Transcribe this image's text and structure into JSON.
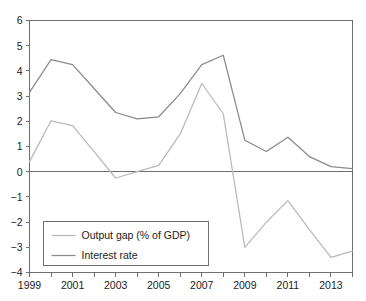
{
  "chart_data": {
    "type": "line",
    "title": "",
    "subtitle": "",
    "xlabel": "",
    "ylabel": "",
    "x": [
      1999,
      2000,
      2001,
      2002,
      2003,
      2004,
      2005,
      2006,
      2007,
      2008,
      2009,
      2010,
      2011,
      2012,
      2013,
      2014
    ],
    "xlim": [
      1999,
      2014
    ],
    "ylim": [
      -4,
      6
    ],
    "grid": false,
    "legend_position": "bottom-left",
    "x_tick_labels": [
      "1999",
      "2001",
      "2003",
      "2005",
      "2007",
      "2009",
      "2011",
      "2013"
    ],
    "x_tick_values": [
      1999,
      2001,
      2003,
      2005,
      2007,
      2009,
      2011,
      2013
    ],
    "x_minor_tick_values": [
      1999,
      2000,
      2001,
      2002,
      2003,
      2004,
      2005,
      2006,
      2007,
      2008,
      2009,
      2010,
      2011,
      2012,
      2013,
      2014
    ],
    "y_tick_labels": [
      "6",
      "5",
      "4",
      "3",
      "2",
      "1",
      "0",
      "−1",
      "−2",
      "−3",
      "−4"
    ],
    "y_tick_values": [
      6,
      5,
      4,
      3,
      2,
      1,
      0,
      -1,
      -2,
      -3,
      -4
    ],
    "zero_line": 0,
    "series": [
      {
        "name": "Output gap (% of GDP)",
        "color": "#b9b9b9",
        "values": [
          0.4,
          2.02,
          1.83,
          0.8,
          -0.25,
          0.0,
          0.25,
          1.5,
          3.5,
          2.3,
          -3.0,
          -2.0,
          -1.15,
          -2.3,
          -3.4,
          -3.15
        ]
      },
      {
        "name": "Interest rate",
        "color": "#8a8a8a",
        "values": [
          3.15,
          4.45,
          4.25,
          3.3,
          2.35,
          2.1,
          2.18,
          3.1,
          4.25,
          4.62,
          1.25,
          0.8,
          1.37,
          0.6,
          0.2,
          0.12
        ]
      }
    ]
  },
  "legend": {
    "entries": [
      {
        "label": "Output gap (% of GDP)",
        "color": "#b9b9b9"
      },
      {
        "label": "Interest rate",
        "color": "#8a8a8a"
      }
    ]
  }
}
